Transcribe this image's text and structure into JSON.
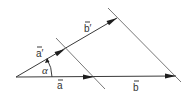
{
  "diagram": {
    "vectors": [
      {
        "id": "a",
        "label": "a⃗",
        "text": "a",
        "ray": "horizontal"
      },
      {
        "id": "b",
        "label": "b⃗",
        "text": "b",
        "ray": "horizontal"
      },
      {
        "id": "a_prime",
        "label": "a⃗′",
        "text": "a′",
        "ray": "upper"
      },
      {
        "id": "b_prime",
        "label": "b⃗′",
        "text": "b′",
        "ray": "upper"
      }
    ],
    "angle": {
      "label": "α"
    },
    "parallel_lines": 2,
    "labels": {
      "a": "a",
      "b": "b",
      "a_prime": "a′",
      "b_prime": "b′",
      "alpha": "α"
    },
    "colors": {
      "stroke": "#3a3a3a",
      "arrow": "#1e1e1e",
      "text": "#333333"
    }
  }
}
